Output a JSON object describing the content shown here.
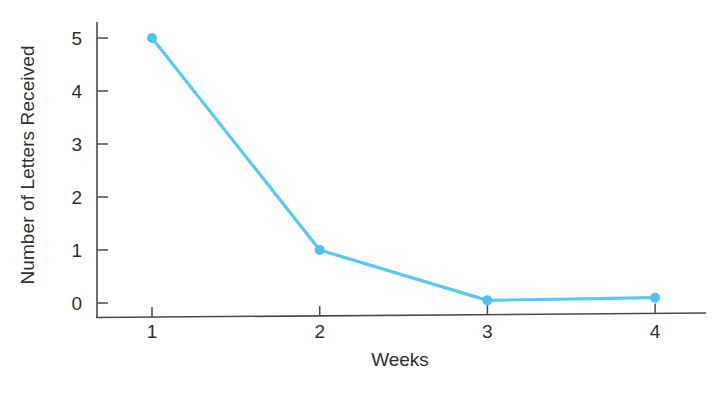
{
  "chart_data": {
    "type": "line",
    "title": "",
    "xlabel": "Weeks",
    "ylabel": "Number of Letters Received",
    "categories": [
      1,
      2,
      3,
      4
    ],
    "x": [
      1,
      2,
      3,
      4
    ],
    "values": [
      5,
      1,
      0.05,
      0.1
    ],
    "series": [
      {
        "name": "Number of Letters Received",
        "values": [
          5,
          1,
          0.05,
          0.1
        ],
        "color": "#5BC8F0"
      }
    ],
    "xlim": [
      0.55,
      4.35
    ],
    "ylim": [
      0,
      5.35
    ],
    "x_tick_labels": [
      "1",
      "2",
      "3",
      "4"
    ],
    "y_tick_labels": [
      "0",
      "1",
      "2",
      "3",
      "4",
      "5"
    ],
    "y_ticks": [
      0,
      1,
      2,
      3,
      4,
      5
    ],
    "grid": false,
    "legend": false,
    "legend_position": "none",
    "marker": "circle",
    "annotations": []
  },
  "axes": {
    "x_title": "Weeks",
    "y_title": "Number of Letters Received"
  },
  "style": {
    "line_color": "#5BC8F0",
    "marker_color": "#4FC3EE",
    "axis_color": "#4a4a4a",
    "text_color": "#2f2f2f",
    "background": "#ffffff"
  }
}
